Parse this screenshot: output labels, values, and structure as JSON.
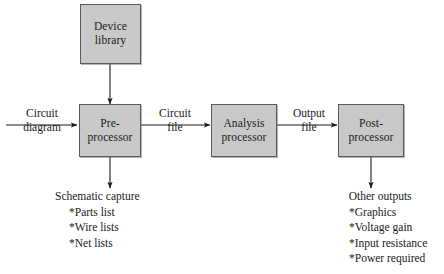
{
  "diagram": {
    "colors": {
      "box_fill": "#c9c9c9",
      "box_border": "#5a5a5a",
      "line": "#1a1a1a",
      "background": "#ffffff"
    },
    "nodes": [
      {
        "id": "device-library",
        "line_a": "Device",
        "line_b": "library"
      },
      {
        "id": "pre-processor",
        "line_a": "Pre-",
        "line_b": "processor"
      },
      {
        "id": "analysis-processor",
        "line_a": "Analysis",
        "line_b": "processor"
      },
      {
        "id": "post-processor",
        "line_a": "Post-",
        "line_b": "processor"
      }
    ],
    "edge_labels": [
      {
        "id": "circuit-diagram",
        "line_a": "Circuit",
        "line_b": "diagram"
      },
      {
        "id": "circuit-file",
        "line_a": "Circuit",
        "line_b": "file"
      },
      {
        "id": "output-file",
        "line_a": "Output",
        "line_b": "file"
      }
    ],
    "lists": [
      {
        "id": "schematic-capture",
        "title": "Schematic capture",
        "items": [
          "*Parts list",
          "*Wire lists",
          "*Net lists"
        ]
      },
      {
        "id": "other-outputs",
        "title": "Other outputs",
        "items": [
          "*Graphics",
          "*Voltage gain",
          "*Input resistance",
          "*Power required"
        ]
      }
    ]
  }
}
